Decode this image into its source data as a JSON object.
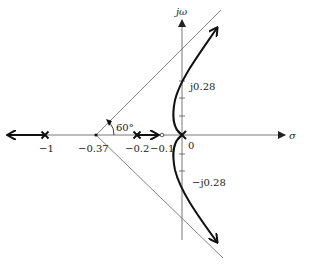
{
  "diagram": {
    "type": "root-locus",
    "axes": {
      "real_label": "σ",
      "imag_label": "jω"
    },
    "real_axis_labels": [
      {
        "id": "pole-neg1",
        "text": "−1"
      },
      {
        "id": "centroid",
        "text": "−0.37"
      },
      {
        "id": "pole-neg02",
        "text": "−0.2"
      },
      {
        "id": "zero-neg01",
        "text": "−0.1"
      },
      {
        "id": "origin",
        "text": "0"
      }
    ],
    "imag_axis_labels": {
      "upper": "j0.28",
      "lower": "−j0.28"
    },
    "asymptote_angle_label": "60°",
    "poles": [
      -1,
      -0.2,
      0,
      0
    ],
    "zeros": [
      -0.1
    ],
    "asymptote_centroid": -0.37,
    "asymptote_angles_deg": [
      60,
      180,
      -60
    ],
    "jw_crossings": [
      "j0.28",
      "−j0.28"
    ],
    "colors": {
      "locus": "#111111",
      "axes": "#555555",
      "asymptotes": "#666666"
    }
  }
}
